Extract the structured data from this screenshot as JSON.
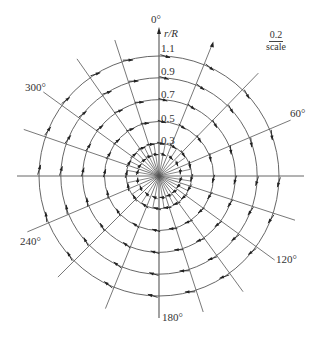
{
  "diagram": {
    "type": "polar-vector-field",
    "axis_label": "r/R",
    "angle_labels": [
      {
        "text": "0°",
        "x": 151,
        "y": 14
      },
      {
        "text": "60°",
        "x": 290,
        "y": 108
      },
      {
        "text": "120°",
        "x": 276,
        "y": 254
      },
      {
        "text": "180°",
        "x": 162,
        "y": 312
      },
      {
        "text": "240°",
        "x": 20,
        "y": 236
      },
      {
        "text": "300°",
        "x": 25,
        "y": 82
      }
    ],
    "radius_labels": [
      "1.1",
      "0.9",
      "0.7",
      "0.5",
      "0.3"
    ],
    "radius_values": [
      1.1,
      0.9,
      0.7,
      0.5,
      0.3
    ],
    "scale_key": {
      "value": "0.2",
      "label": "scale"
    },
    "center": {
      "x": 159,
      "y": 176
    },
    "outer_radius_px": 120,
    "radial_line_angles_deg": [
      0,
      22,
      44,
      67,
      90,
      108,
      126,
      144,
      162,
      180,
      202,
      225,
      247,
      270,
      289,
      306,
      325,
      342
    ],
    "inner_radial_angles_deg": [
      11,
      33,
      55,
      78,
      99,
      117,
      135,
      153,
      171,
      191,
      213,
      236,
      258,
      280,
      297,
      316,
      333,
      351
    ],
    "line_color": "#555555",
    "arrow_color": "#222222"
  }
}
